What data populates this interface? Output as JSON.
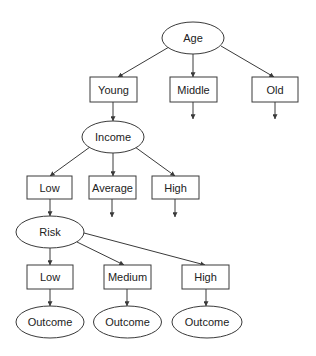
{
  "diagram": {
    "type": "decision-tree",
    "colors": {
      "stroke": "#3a3a3a",
      "text": "#222222",
      "background": "#ffffff"
    },
    "nodes": {
      "age": {
        "label": "Age",
        "shape": "ellipse"
      },
      "young": {
        "label": "Young",
        "shape": "box"
      },
      "middle": {
        "label": "Middle",
        "shape": "box"
      },
      "old": {
        "label": "Old",
        "shape": "box"
      },
      "income": {
        "label": "Income",
        "shape": "ellipse"
      },
      "income_low": {
        "label": "Low",
        "shape": "box"
      },
      "income_average": {
        "label": "Average",
        "shape": "box"
      },
      "income_high": {
        "label": "High",
        "shape": "box"
      },
      "risk": {
        "label": "Risk",
        "shape": "ellipse"
      },
      "risk_low": {
        "label": "Low",
        "shape": "box"
      },
      "risk_medium": {
        "label": "Medium",
        "shape": "box"
      },
      "risk_high": {
        "label": "High",
        "shape": "box"
      },
      "outcome_1": {
        "label": "Outcome",
        "shape": "ellipse"
      },
      "outcome_2": {
        "label": "Outcome",
        "shape": "ellipse"
      },
      "outcome_3": {
        "label": "Outcome",
        "shape": "ellipse"
      }
    },
    "edges": [
      [
        "Age",
        "Young"
      ],
      [
        "Age",
        "Middle"
      ],
      [
        "Age",
        "Old"
      ],
      [
        "Young",
        "Income"
      ],
      [
        "Middle",
        "(continues)"
      ],
      [
        "Old",
        "(continues)"
      ],
      [
        "Income",
        "Low"
      ],
      [
        "Income",
        "Average"
      ],
      [
        "Income",
        "High"
      ],
      [
        "Low",
        "Risk"
      ],
      [
        "Average",
        "(continues)"
      ],
      [
        "High",
        "(continues)"
      ],
      [
        "Risk",
        "Low"
      ],
      [
        "Risk",
        "Medium"
      ],
      [
        "Risk",
        "High"
      ],
      [
        "Low",
        "Outcome"
      ],
      [
        "Medium",
        "Outcome"
      ],
      [
        "High",
        "Outcome"
      ]
    ]
  }
}
